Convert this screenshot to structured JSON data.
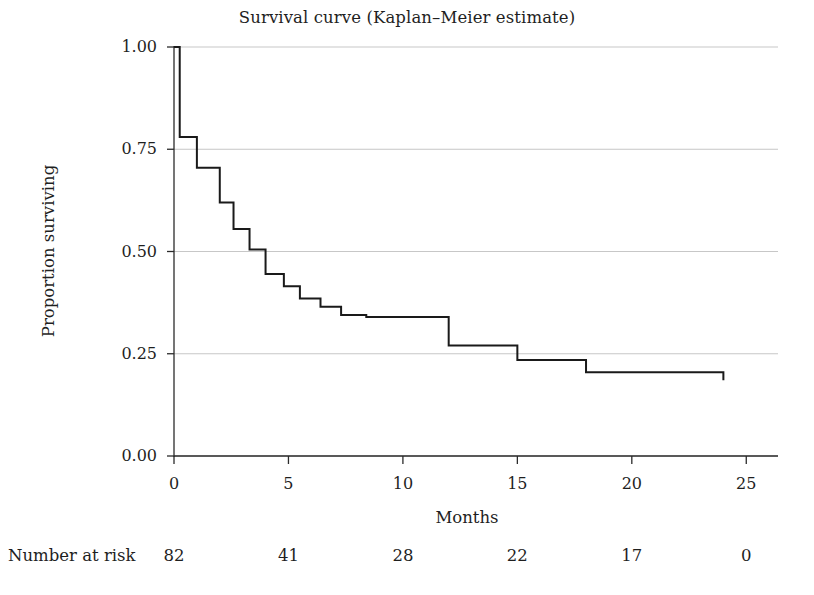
{
  "chart_data": {
    "type": "line",
    "title": "Survival curve (Kaplan–Meier estimate)",
    "xlabel": "Months",
    "ylabel": "Proportion surviving",
    "xlim": [
      0,
      25.6
    ],
    "ylim": [
      0.0,
      1.0
    ],
    "grid": true,
    "grid_axis": "y",
    "legend": "none",
    "line_color": "#1a1a1a",
    "line_width": 2.0,
    "xticks": [
      0,
      5,
      10,
      15,
      20,
      25
    ],
    "xtick_labels": [
      "0",
      "5",
      "10",
      "15",
      "20",
      "25"
    ],
    "yticks": [
      0.0,
      0.25,
      0.5,
      0.75,
      1.0
    ],
    "ytick_labels": [
      "0.00",
      "0.25",
      "0.50",
      "0.75",
      "1.00"
    ],
    "step_style": "post",
    "series": [
      {
        "name": "Kaplan-Meier survival estimate",
        "x": [
          0,
          0.25,
          0.25,
          1.0,
          1.0,
          2.0,
          2.0,
          2.6,
          2.6,
          3.3,
          3.3,
          4.0,
          4.0,
          4.8,
          4.8,
          5.5,
          5.5,
          6.4,
          6.4,
          7.3,
          7.3,
          8.4,
          8.4,
          9.0,
          9.0,
          12.0,
          12.0,
          15.0,
          15.0,
          18.0,
          18.0,
          24.0,
          24.0
        ],
        "y": [
          1.0,
          1.0,
          0.78,
          0.78,
          0.705,
          0.705,
          0.62,
          0.62,
          0.555,
          0.555,
          0.505,
          0.505,
          0.445,
          0.445,
          0.415,
          0.415,
          0.385,
          0.385,
          0.365,
          0.365,
          0.345,
          0.345,
          0.34,
          0.34,
          0.34,
          0.34,
          0.27,
          0.27,
          0.235,
          0.235,
          0.205,
          0.205,
          0.185
        ]
      }
    ],
    "risk_table": {
      "label": "Number at risk",
      "times": [
        0,
        5,
        10,
        15,
        20,
        25
      ],
      "counts": [
        "82",
        "41",
        "28",
        "22",
        "17",
        "0"
      ]
    }
  }
}
